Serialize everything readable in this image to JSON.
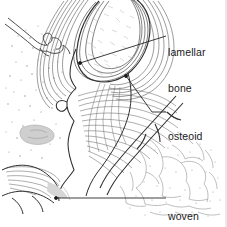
{
  "figure": {
    "type": "histology-line-drawing",
    "background_color": "#ffffff",
    "ink_color": "#3a3a3a",
    "label_color": "#1a1a1a",
    "width": 227,
    "height": 227
  },
  "labels": {
    "lamellar": {
      "line1": "lamellar",
      "line2": "bone",
      "leader": {
        "anchor_x": 80,
        "anchor_y": 63,
        "elbow_x": 150,
        "elbow_y": 36,
        "end_x": 166,
        "end_y": 36
      }
    },
    "osteoid": {
      "line1": "osteoid",
      "line2": "",
      "leader": {
        "anchor_x": 126,
        "anchor_y": 76,
        "elbow_x": 152,
        "elbow_y": 113,
        "end_x": 166,
        "end_y": 113
      }
    },
    "woven": {
      "line1": "woven",
      "line2": "bone",
      "leader": {
        "anchor_x": 56,
        "anchor_y": 198,
        "elbow_x": 166,
        "elbow_y": 198,
        "end_x": 166,
        "end_y": 198
      }
    }
  },
  "regions": [
    {
      "name": "lamellar-bone-island",
      "note": "rounded trabecular island, upper centre, concentric lamellae"
    },
    {
      "name": "osteoid-seam",
      "note": "fibrous sweeping striations, mid right of centre"
    },
    {
      "name": "woven-bone-field",
      "note": "irregular mesh, lower right"
    },
    {
      "name": "marrow-stipple",
      "note": "scattered cell dots, left field"
    }
  ]
}
